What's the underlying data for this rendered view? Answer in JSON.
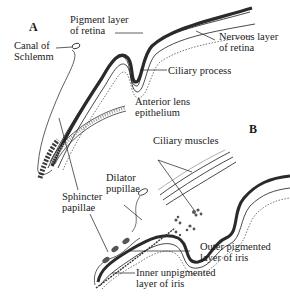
{
  "figure": {
    "panels": [
      {
        "id": "A",
        "letter": "A"
      },
      {
        "id": "B",
        "letter": "B"
      }
    ],
    "labels": {
      "pigment_layer_1": "Pigment layer",
      "pigment_layer_2": "of retina",
      "nervous_layer_1": "Nervous layer",
      "nervous_layer_2": "of retina",
      "canal_1": "Canal of",
      "canal_2": "Schlemm",
      "ciliary_process": "Ciliary process",
      "anterior_lens_1": "Anterior lens",
      "anterior_lens_2": "epithelium",
      "ciliary_muscles": "Ciliary muscles",
      "dilator_1": "Dilator",
      "dilator_2": "pupillae",
      "sphincter_1": "Sphincter",
      "sphincter_2": "papillae",
      "outer_pigmented_1": "Outer pigmented",
      "outer_pigmented_2": "layer of iris",
      "inner_unpigmented_1": "Inner unpigmented",
      "inner_unpigmented_2": "layer of iris"
    },
    "colors": {
      "ink": "#1a1a1a",
      "pigment": "#2a2a2a",
      "stipple": "#888888",
      "background": "#ffffff"
    }
  }
}
